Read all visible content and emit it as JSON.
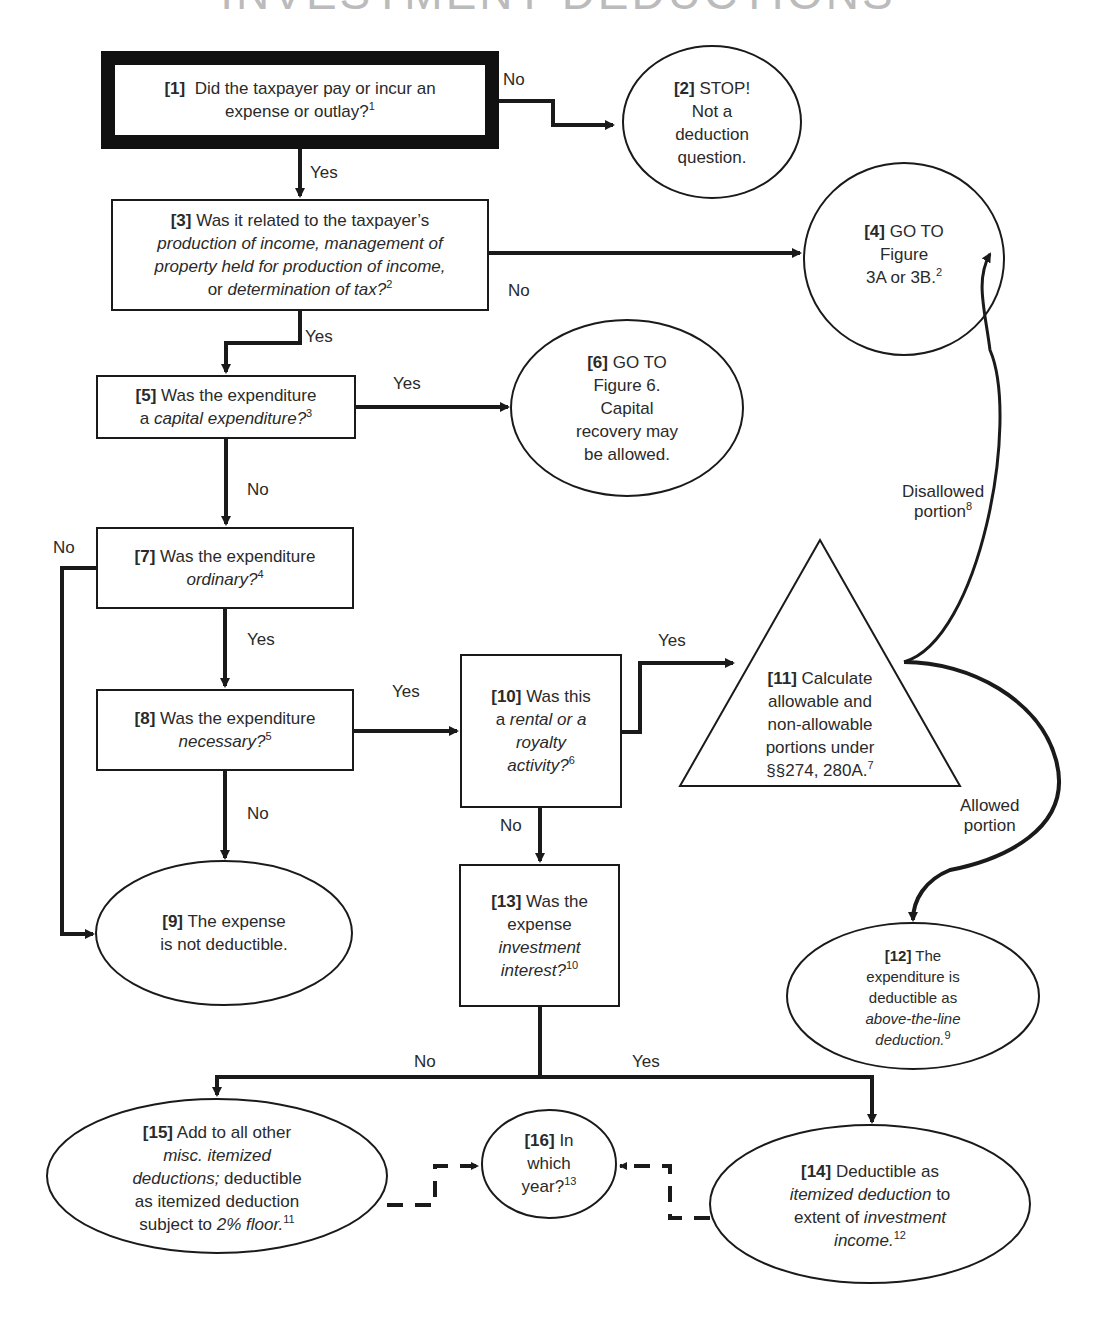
{
  "title": "INVESTMENT DEDUCTIONS",
  "nodes": {
    "n1": {
      "num": "[1]",
      "lines": [
        [
          "Did the taxpayer pay or incur an"
        ],
        [
          "expense or outlay?",
          {
            "sup": "1"
          }
        ]
      ]
    },
    "n2": {
      "num": "[2]",
      "l1": "STOP!",
      "l2": "Not a",
      "l3": "deduction",
      "l4": "question."
    },
    "n3": {
      "num": "[3]",
      "l1": "Was it related to the taxpayer’s",
      "l2_i": "production of income, management of",
      "l3_i": "property held for production of income,",
      "l4_pre": "or ",
      "l4_i": "determination of tax?",
      "l4_sup": "2"
    },
    "n4": {
      "num": "[4]",
      "l1": "GO TO",
      "l2": "Figure",
      "l3": "3A or 3B.",
      "l3_sup": "2"
    },
    "n5": {
      "num": "[5]",
      "l1": "Was the expenditure",
      "l2_pre": "a ",
      "l2_i": "capital expenditure?",
      "l2_sup": "3"
    },
    "n6": {
      "num": "[6]",
      "l1": "GO TO",
      "l2": "Figure 6.",
      "l3": "Capital",
      "l4": "recovery may",
      "l5": "be allowed."
    },
    "n7": {
      "num": "[7]",
      "l1": "Was the expenditure",
      "l2_i": "ordinary?",
      "l2_sup": "4"
    },
    "n8": {
      "num": "[8]",
      "l1": "Was the expenditure",
      "l2_i": "necessary?",
      "l2_sup": "5"
    },
    "n9": {
      "num": "[9]",
      "l1": "The expense",
      "l2": "is not deductible."
    },
    "n10": {
      "num": "[10]",
      "l1": "Was this",
      "l2_pre": "a ",
      "l2_i": "rental or a",
      "l3_i": "royalty",
      "l4_i": "activity?",
      "l4_sup": "6"
    },
    "n11": {
      "num": "[11]",
      "l1": "Calculate",
      "l2": "allowable and",
      "l3": "non-allowable",
      "l4": "portions under",
      "l5": "§§274, 280A.",
      "l5_sup": "7"
    },
    "n12": {
      "num": "[12]",
      "l1": "The",
      "l2": "expenditure is",
      "l3": "deductible as",
      "l4_i": "above-the-line",
      "l5_i": "deduction.",
      "l5_sup": "9"
    },
    "n13": {
      "num": "[13]",
      "l1": "Was the",
      "l2": "expense",
      "l3_i": "investment",
      "l4_i": "interest?",
      "l4_sup": "10"
    },
    "n14": {
      "num": "[14]",
      "l1": "Deductible as",
      "l2_i": "itemized deduction",
      "l2_post": " to",
      "l3_pre": "extent of ",
      "l3_i": "investment",
      "l4_i": "income.",
      "l4_sup": "12"
    },
    "n15": {
      "num": "[15]",
      "l1": "Add to all other",
      "l2_i": "misc. itemized",
      "l3_i": "deductions;",
      "l3_post": " deductible",
      "l4": "as itemized deduction",
      "l5_pre": "subject to ",
      "l5_i": "2% floor.",
      "l5_sup": "11"
    },
    "n16": {
      "num": "[16]",
      "l1": "In",
      "l2": "which",
      "l3": "year?",
      "l3_sup": "13"
    }
  },
  "edge_labels": {
    "e1_2": "No",
    "e1_3": "Yes",
    "e3_4": "No",
    "e3_5": "Yes",
    "e5_6": "Yes",
    "e5_7": "No",
    "e7_9": "No",
    "e7_8": "Yes",
    "e8_10": "Yes",
    "e8_9": "No",
    "e10_11": "Yes",
    "e10_13": "No",
    "e11_4_l1": "Disallowed",
    "e11_4_l2": "portion",
    "e11_4_sup": "8",
    "e11_12_l1": "Allowed",
    "e11_12_l2": "portion",
    "e13_15": "No",
    "e13_14": "Yes"
  },
  "colors": {
    "stroke": "#1a1a1a",
    "text": "#2a2a2a",
    "background": "#ffffff"
  }
}
